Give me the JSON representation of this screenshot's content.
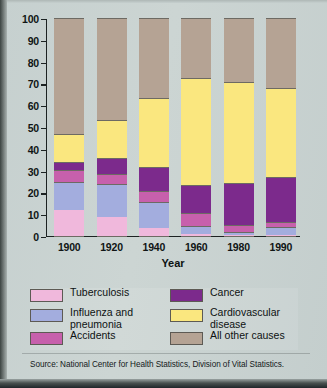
{
  "chart_data": {
    "type": "bar",
    "subtype": "stacked-bar",
    "title": "",
    "xlabel": "Year",
    "ylabel": "Percent of All Deaths",
    "categories": [
      "1900",
      "1920",
      "1940",
      "1960",
      "1980",
      "1990"
    ],
    "ylim": [
      0,
      100
    ],
    "yticks": [
      0,
      10,
      20,
      30,
      40,
      50,
      60,
      70,
      80,
      90,
      100
    ],
    "grid": false,
    "legend_position": "bottom",
    "stack_order_bottom_to_top": [
      "Tuberculosis",
      "Influenza and pneumonia",
      "Accidents",
      "Cancer",
      "Cardiovascular disease",
      "All other causes"
    ],
    "series": [
      {
        "name": "Tuberculosis",
        "color": "#f0b8dc",
        "values": [
          12.0,
          8.5,
          3.5,
          1.0,
          0.5,
          0.5
        ]
      },
      {
        "name": "Influenza and pneumonia",
        "color": "#a3adde",
        "values": [
          13.0,
          15.5,
          12.0,
          3.5,
          1.5,
          3.5
        ]
      },
      {
        "name": "Accidents",
        "color": "#c760ac",
        "values": [
          5.5,
          4.5,
          5.0,
          6.0,
          3.0,
          2.5
        ]
      },
      {
        "name": "Cancer",
        "color": "#7c2a8c",
        "values": [
          3.5,
          7.5,
          11.0,
          13.0,
          19.5,
          20.5
        ]
      },
      {
        "name": "Cardiovascular disease",
        "color": "#fae77f",
        "values": [
          13.0,
          17.0,
          32.0,
          49.0,
          46.0,
          41.0
        ]
      },
      {
        "name": "All other causes",
        "color": "#b5a394",
        "values": [
          53.0,
          47.0,
          36.5,
          27.5,
          29.5,
          32.0
        ]
      }
    ],
    "cumulative_tops": {
      "1900": {
        "Tuberculosis": 12.0,
        "Influenza and pneumonia": 25.0,
        "Accidents": 30.5,
        "Cancer": 34.0,
        "Cardiovascular disease": 47.0,
        "All other causes": 100
      },
      "1920": {
        "Tuberculosis": 8.5,
        "Influenza and pneumonia": 24.0,
        "Accidents": 28.5,
        "Cancer": 36.0,
        "Cardiovascular disease": 53.0,
        "All other causes": 100
      },
      "1940": {
        "Tuberculosis": 3.5,
        "Influenza and pneumonia": 15.5,
        "Accidents": 20.5,
        "Cancer": 31.5,
        "Cardiovascular disease": 63.5,
        "All other causes": 100
      },
      "1960": {
        "Tuberculosis": 1.0,
        "Influenza and pneumonia": 4.5,
        "Accidents": 10.5,
        "Cancer": 23.5,
        "Cardiovascular disease": 72.5,
        "All other causes": 100
      },
      "1980": {
        "Tuberculosis": 0.5,
        "Influenza and pneumonia": 2.0,
        "Accidents": 5.0,
        "Cancer": 24.5,
        "Cardiovascular disease": 70.5,
        "All other causes": 100
      },
      "1990": {
        "Tuberculosis": 0.5,
        "Influenza and pneumonia": 4.0,
        "Accidents": 6.5,
        "Cancer": 27.0,
        "Cardiovascular disease": 68.0,
        "All other causes": 100
      }
    }
  },
  "axis": {
    "y_title": "Percent of All Deaths",
    "x_title": "Year",
    "y_tick_labels": [
      "100",
      "90",
      "80",
      "70",
      "60",
      "50",
      "40",
      "30",
      "20",
      "10",
      "0"
    ],
    "x_tick_labels": [
      "1900",
      "1920",
      "1940",
      "1960",
      "1980",
      "1990"
    ]
  },
  "legend": {
    "left": [
      {
        "label": "Tuberculosis",
        "color": "#f0b8dc"
      },
      {
        "label": "Influenza and\npneumonia",
        "color": "#a3adde"
      },
      {
        "label": "Accidents",
        "color": "#c760ac"
      }
    ],
    "right": [
      {
        "label": "Cancer",
        "color": "#7c2a8c"
      },
      {
        "label": "Cardiovascular\ndisease",
        "color": "#fae77f"
      },
      {
        "label": "All other causes",
        "color": "#b5a394"
      }
    ]
  },
  "footer": {
    "source": "Source:  National Center for Health Statistics, Division of Vital Statistics."
  }
}
